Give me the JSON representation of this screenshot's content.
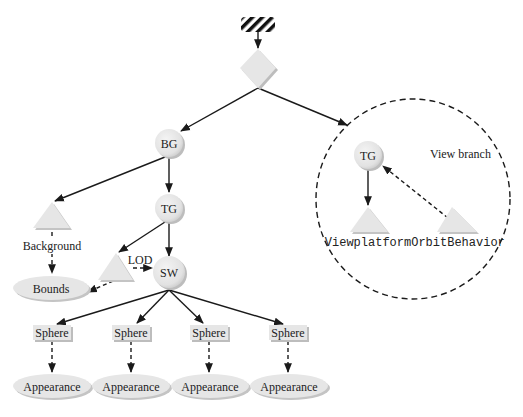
{
  "diagram": {
    "root": {
      "type": "hatched-locale"
    },
    "virtual_universe": {
      "type": "diamond"
    },
    "content_branch": {
      "bg": {
        "label": "BG"
      },
      "tg": {
        "label": "TG"
      },
      "sw": {
        "label": "SW"
      },
      "background": {
        "label": "Background"
      },
      "bounds": {
        "label": "Bounds"
      },
      "lod": {
        "label": "LOD"
      },
      "spheres": [
        {
          "label": "Sphere",
          "appearance": "Appearance"
        },
        {
          "label": "Sphere",
          "appearance": "Appearance"
        },
        {
          "label": "Sphere",
          "appearance": "Appearance"
        },
        {
          "label": "Sphere",
          "appearance": "Appearance"
        }
      ]
    },
    "view_branch": {
      "title": "View branch",
      "tg": {
        "label": "TG"
      },
      "viewplatform": {
        "label": "Viewplatform"
      },
      "orbit": {
        "label": "OrbitBehavior"
      }
    },
    "colors": {
      "node_fill": "#e6e6e6",
      "node_shadow": "#bdbdbd",
      "edge": "#1a1a1a",
      "background": "#ffffff"
    }
  }
}
